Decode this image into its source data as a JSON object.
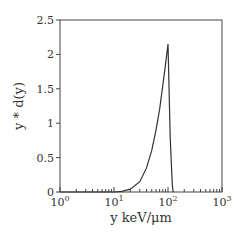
{
  "chart_data": {
    "type": "line",
    "title": "",
    "xlabel": "y keV/μm",
    "ylabel": "y * d(y)",
    "xscale": "log",
    "xlim": [
      1,
      1000
    ],
    "ylim": [
      0,
      2.5
    ],
    "grid": false,
    "legend": null,
    "xticks": [
      {
        "value": 1,
        "base": "10",
        "exp": "0"
      },
      {
        "value": 10,
        "base": "10",
        "exp": "1"
      },
      {
        "value": 100,
        "base": "10",
        "exp": "2"
      },
      {
        "value": 1000,
        "base": "10",
        "exp": "3"
      }
    ],
    "yticks": [
      "0",
      "0.5",
      "1",
      "1.5",
      "2",
      "2.5"
    ],
    "series": [
      {
        "name": "y*d(y)",
        "x": [
          1,
          10,
          14,
          20,
          30,
          40,
          50,
          60,
          70,
          80,
          90,
          100,
          110,
          120,
          125
        ],
        "y": [
          0,
          0,
          0.01,
          0.04,
          0.15,
          0.35,
          0.6,
          0.9,
          1.2,
          1.55,
          1.85,
          2.15,
          0.8,
          0.1,
          0
        ]
      }
    ]
  }
}
